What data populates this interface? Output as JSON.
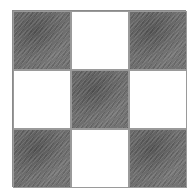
{
  "figure": {
    "type": "checkerboard-grid",
    "rows": 3,
    "cols": 3,
    "style": "pencil-shaded",
    "colors": {
      "shaded": "#6e6e6e",
      "blank": "#ffffff",
      "line": "#8a8a8a"
    },
    "cells": [
      [
        "shaded",
        "blank",
        "shaded"
      ],
      [
        "blank",
        "shaded",
        "blank"
      ],
      [
        "shaded",
        "blank",
        "shaded"
      ]
    ]
  }
}
